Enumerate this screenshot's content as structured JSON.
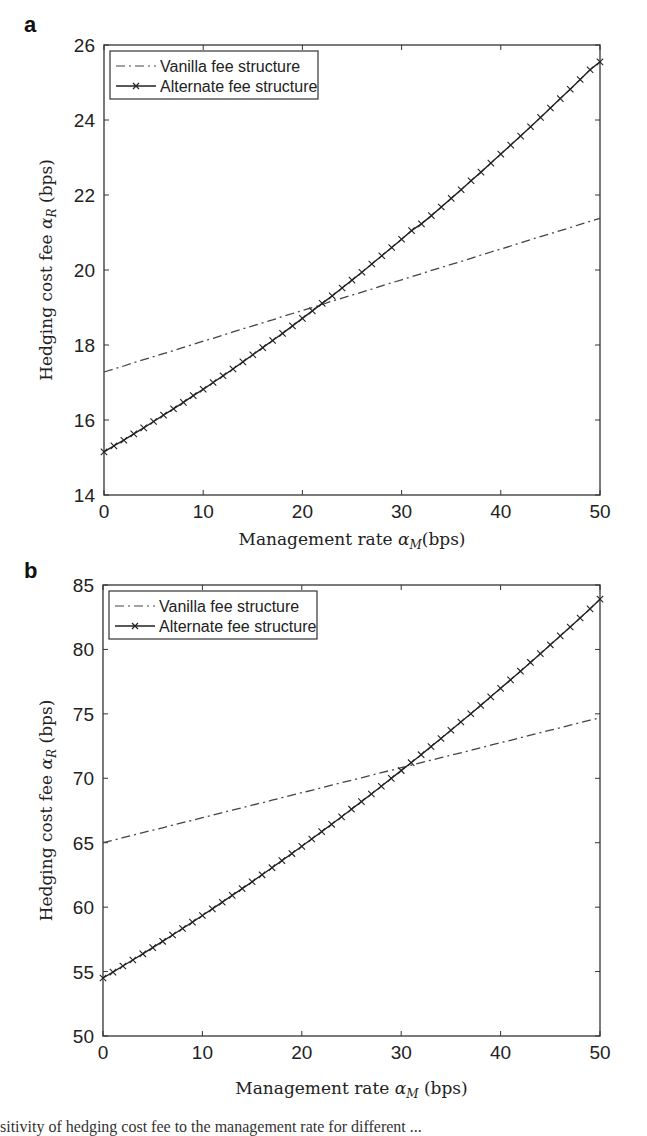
{
  "chart_data": [
    {
      "panel": "a",
      "type": "line",
      "title": "",
      "xlabel": "Management rate α_M(bps)",
      "ylabel": "Hedging cost fee α_R (bps)",
      "xlim": [
        0,
        50
      ],
      "ylim": [
        14,
        26
      ],
      "xticks": [
        0,
        10,
        20,
        30,
        40,
        50
      ],
      "yticks": [
        14,
        16,
        18,
        20,
        22,
        24,
        26
      ],
      "grid": false,
      "legend_position": "upper left",
      "x": [
        0,
        1,
        2,
        3,
        4,
        5,
        6,
        7,
        8,
        9,
        10,
        11,
        12,
        13,
        14,
        15,
        16,
        17,
        18,
        19,
        20,
        21,
        22,
        23,
        24,
        25,
        26,
        27,
        28,
        29,
        30,
        31,
        32,
        33,
        34,
        35,
        36,
        37,
        38,
        39,
        40,
        41,
        42,
        43,
        44,
        45,
        46,
        47,
        48,
        49,
        50
      ],
      "series": [
        {
          "name": "Vanilla fee structure",
          "style": "dash-dot",
          "values": [
            17.28,
            17.36,
            17.44,
            17.53,
            17.61,
            17.69,
            17.77,
            17.85,
            17.94,
            18.02,
            18.1,
            18.18,
            18.26,
            18.35,
            18.43,
            18.51,
            18.59,
            18.67,
            18.76,
            18.84,
            18.92,
            19.0,
            19.08,
            19.17,
            19.25,
            19.33,
            19.41,
            19.49,
            19.58,
            19.66,
            19.74,
            19.82,
            19.9,
            19.99,
            20.07,
            20.15,
            20.23,
            20.31,
            20.4,
            20.48,
            20.56,
            20.64,
            20.72,
            20.81,
            20.89,
            20.97,
            21.05,
            21.13,
            21.22,
            21.3,
            21.38
          ]
        },
        {
          "name": "Alternate fee structure",
          "style": "solid-x-markers",
          "values": [
            15.15,
            15.31,
            15.46,
            15.63,
            15.79,
            15.96,
            16.13,
            16.3,
            16.47,
            16.65,
            16.82,
            17.0,
            17.18,
            17.36,
            17.55,
            17.74,
            17.93,
            18.12,
            18.31,
            18.51,
            18.71,
            18.91,
            19.11,
            19.31,
            19.52,
            19.73,
            19.94,
            20.16,
            20.38,
            20.6,
            20.82,
            21.05,
            21.23,
            21.45,
            21.68,
            21.91,
            22.14,
            22.38,
            22.61,
            22.85,
            23.09,
            23.33,
            23.57,
            23.82,
            24.07,
            24.32,
            24.57,
            24.82,
            25.08,
            25.34,
            25.55
          ]
        }
      ]
    },
    {
      "panel": "b",
      "type": "line",
      "title": "",
      "xlabel": "Management rate α_M (bps)",
      "ylabel": "Hedging cost fee α_R (bps)",
      "xlim": [
        0,
        50
      ],
      "ylim": [
        50,
        85
      ],
      "xticks": [
        0,
        10,
        20,
        30,
        40,
        50
      ],
      "yticks": [
        50,
        55,
        60,
        65,
        70,
        75,
        80,
        85
      ],
      "grid": false,
      "legend_position": "upper left",
      "x": [
        0,
        1,
        2,
        3,
        4,
        5,
        6,
        7,
        8,
        9,
        10,
        11,
        12,
        13,
        14,
        15,
        16,
        17,
        18,
        19,
        20,
        21,
        22,
        23,
        24,
        25,
        26,
        27,
        28,
        29,
        30,
        31,
        32,
        33,
        34,
        35,
        36,
        37,
        38,
        39,
        40,
        41,
        42,
        43,
        44,
        45,
        46,
        47,
        48,
        49,
        50
      ],
      "series": [
        {
          "name": "Vanilla fee structure",
          "style": "dash-dot",
          "values": [
            65.0,
            65.19,
            65.39,
            65.58,
            65.78,
            65.97,
            66.16,
            66.36,
            66.55,
            66.75,
            66.94,
            67.13,
            67.33,
            67.52,
            67.72,
            67.91,
            68.1,
            68.3,
            68.49,
            68.69,
            68.88,
            69.07,
            69.27,
            69.46,
            69.66,
            69.85,
            70.04,
            70.24,
            70.43,
            70.63,
            70.82,
            71.01,
            71.21,
            71.4,
            71.6,
            71.79,
            71.98,
            72.18,
            72.37,
            72.57,
            72.76,
            72.95,
            73.15,
            73.34,
            73.54,
            73.73,
            73.92,
            74.12,
            74.31,
            74.51,
            74.7
          ]
        },
        {
          "name": "Alternate fee structure",
          "style": "solid-x-markers",
          "values": [
            54.5,
            54.96,
            55.43,
            55.9,
            56.38,
            56.86,
            57.35,
            57.84,
            58.34,
            58.84,
            59.35,
            59.87,
            60.38,
            60.91,
            61.44,
            61.97,
            62.51,
            63.06,
            63.61,
            64.16,
            64.72,
            65.29,
            65.86,
            66.43,
            67.01,
            67.6,
            68.19,
            68.78,
            69.38,
            69.99,
            70.6,
            71.21,
            71.83,
            72.46,
            73.09,
            73.73,
            74.37,
            75.01,
            75.66,
            76.32,
            76.98,
            77.64,
            78.31,
            78.99,
            79.67,
            80.36,
            81.05,
            81.74,
            82.44,
            83.15,
            83.9
          ]
        }
      ]
    }
  ],
  "panels": [
    {
      "letter": "a",
      "ylabel_main": "Hedging cost fee ",
      "ylabel_sym": "α",
      "ylabel_sub": "R",
      "ylabel_unit": " (bps)",
      "xlabel_main": "Management rate ",
      "xlabel_sym": "α",
      "xlabel_sub": "M",
      "xlabel_unit": "(bps)",
      "legend": [
        "Vanilla fee structure",
        "Alternate fee structure"
      ]
    },
    {
      "letter": "b",
      "ylabel_main": "Hedging cost fee ",
      "ylabel_sym": "α",
      "ylabel_sub": "R",
      "ylabel_unit": " (bps)",
      "xlabel_main": "Management rate ",
      "xlabel_sym": "α",
      "xlabel_sub": "M",
      "xlabel_unit": " (bps)",
      "legend": [
        "Vanilla fee structure",
        "Alternate fee structure"
      ]
    }
  ],
  "caption_fragment": "sitivity of hedging cost fee to the management rate for different ..."
}
